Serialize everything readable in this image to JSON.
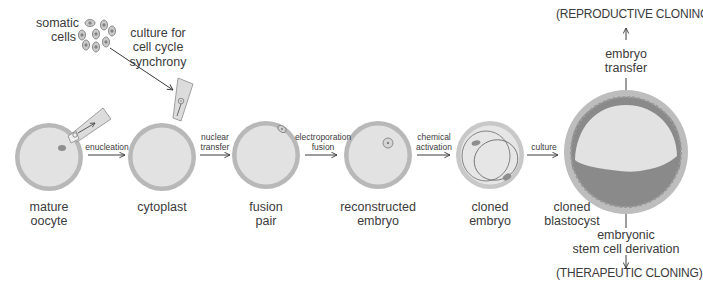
{
  "diagram": {
    "colors": {
      "zona": "#b8b8b8",
      "cytoplasm": "#e2e2e2",
      "nucleus": "#8e8e8e",
      "trophectoderm": "#8a8a8a",
      "line": "#3a3a3a"
    },
    "somatic": {
      "label": "somatic\ncells",
      "culture_label": "culture for\ncell cycle\nsynchrony"
    },
    "stages": [
      {
        "id": "mature-oocyte",
        "label": "mature\noocyte"
      },
      {
        "id": "cytoplast",
        "label": "cytoplast"
      },
      {
        "id": "fusion-pair",
        "label": "fusion\npair"
      },
      {
        "id": "reconstructed-embryo",
        "label": "reconstructed\nembryo"
      },
      {
        "id": "cloned-embryo",
        "label": "cloned\nembryo"
      },
      {
        "id": "cloned-blastocyst",
        "label": "cloned\nblastocyst"
      }
    ],
    "steps": [
      {
        "id": "enucleation",
        "label": "enucleation"
      },
      {
        "id": "nuclear-transfer",
        "label": "nuclear\ntransfer"
      },
      {
        "id": "electroporation-fusion",
        "label": "electroporation\nfusion"
      },
      {
        "id": "chemical-activation",
        "label": "chemical\nactivation"
      },
      {
        "id": "culture",
        "label": "culture"
      }
    ],
    "outcomes": {
      "reproductive": {
        "step": "embryo\ntransfer",
        "label": "(REPRODUCTIVE CLONING)"
      },
      "therapeutic": {
        "step": "embryonic\nstem cell derivation",
        "label": "(THERAPEUTIC CLONING)"
      }
    }
  }
}
